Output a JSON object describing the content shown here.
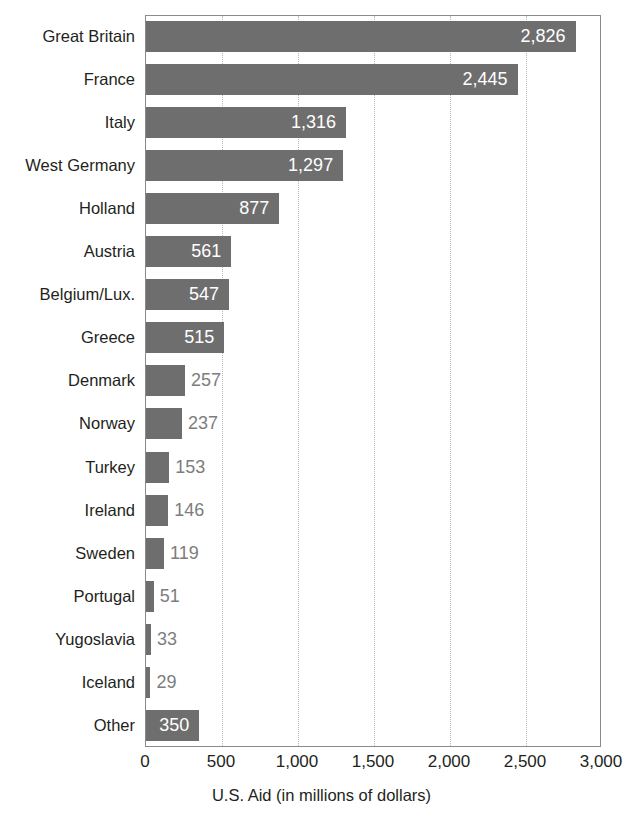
{
  "chart_data": {
    "type": "bar",
    "orientation": "horizontal",
    "title": "",
    "xlabel": "U.S. Aid (in millions of dollars)",
    "ylabel": "",
    "xlim": [
      0,
      3000
    ],
    "xticks": [
      0,
      500,
      1000,
      1500,
      2000,
      2500,
      3000
    ],
    "xtick_labels": [
      "0",
      "500",
      "1,000",
      "1,500",
      "2,000",
      "2,500",
      "3,000"
    ],
    "grid": "vertical-dotted",
    "legend": "none",
    "bar_color": "#6e6e6e",
    "inside_label_color": "#ffffff",
    "outside_label_color": "#7d7d7d",
    "categories": [
      "Great Britain",
      "France",
      "Italy",
      "West Germany",
      "Holland",
      "Austria",
      "Belgium/Lux.",
      "Greece",
      "Denmark",
      "Norway",
      "Turkey",
      "Ireland",
      "Sweden",
      "Portugal",
      "Yugoslavia",
      "Iceland",
      "Other"
    ],
    "values": [
      2826,
      2445,
      1316,
      1297,
      877,
      561,
      547,
      515,
      257,
      237,
      153,
      146,
      119,
      51,
      33,
      29,
      350
    ],
    "value_labels": [
      "2,826",
      "2,445",
      "1,316",
      "1,297",
      "877",
      "561",
      "547",
      "515",
      "257",
      "237",
      "153",
      "146",
      "119",
      "51",
      "33",
      "29",
      "350"
    ],
    "label_placement": [
      "inside",
      "inside",
      "inside",
      "inside",
      "inside",
      "inside",
      "inside",
      "inside",
      "outside",
      "outside",
      "outside",
      "outside",
      "outside",
      "outside",
      "outside",
      "outside",
      "inside"
    ]
  }
}
